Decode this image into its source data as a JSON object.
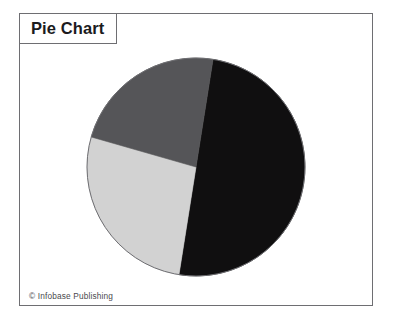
{
  "figure": {
    "title": "Pie Chart",
    "credit": "© Infobase Publishing",
    "background_color": "#ffffff",
    "frame_color": "#6e6e72"
  },
  "chart_data": {
    "type": "pie",
    "title": "Pie Chart",
    "subtitle": "",
    "xlabel": "",
    "ylabel": "",
    "legend": "none",
    "grid": false,
    "start_angle_deg": 9,
    "direction": "clockwise",
    "labels": [
      "Slice 1",
      "Slice 2",
      "Slice 3"
    ],
    "values": [
      50,
      27,
      23
    ],
    "colors": [
      "#100f10",
      "#d2d2d2",
      "#555558"
    ],
    "slices": [
      {
        "label": "Slice 1",
        "value": 50,
        "percent": 50,
        "color": "#100f10",
        "start_angle_deg": 9,
        "end_angle_deg": 189
      },
      {
        "label": "Slice 2",
        "value": 27,
        "percent": 27,
        "color": "#d2d2d2",
        "start_angle_deg": 189,
        "end_angle_deg": 286
      },
      {
        "label": "Slice 3",
        "value": 23,
        "percent": 23,
        "color": "#555558",
        "start_angle_deg": 286,
        "end_angle_deg": 369
      }
    ],
    "geometry": {
      "center_x": 177,
      "center_y": 154,
      "radius": 109,
      "outline_color": "#6e6e72"
    }
  }
}
